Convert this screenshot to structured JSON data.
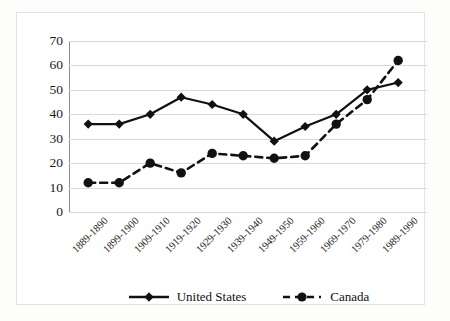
{
  "chart_data": {
    "type": "line",
    "title": "",
    "subtitle": "",
    "xlabel": "",
    "ylabel": "",
    "ylim": [
      0,
      70
    ],
    "ytick_step": 10,
    "yticks": [
      70,
      60,
      50,
      40,
      30,
      20,
      10,
      0
    ],
    "grid": true,
    "legend_position": "bottom",
    "categories": [
      "1889-1890",
      "1899-1900",
      "1909-1910",
      "1919-1920",
      "1929-1930",
      "1939-1940",
      "1949-1950",
      "1959-1960",
      "1969-1970",
      "1979-1980",
      "1989-1990"
    ],
    "series": [
      {
        "name": "United States",
        "values": [
          36,
          36,
          40,
          47,
          44,
          40,
          29,
          35,
          40,
          50,
          53
        ],
        "line_style": "solid",
        "marker": "diamond",
        "color": "#111111"
      },
      {
        "name": "Canada",
        "values": [
          12,
          12,
          20,
          16,
          24,
          23,
          22,
          23,
          36,
          46,
          62
        ],
        "line_style": "dashed",
        "marker": "circle",
        "color": "#111111"
      }
    ]
  },
  "legend": {
    "items": [
      {
        "label": "United States",
        "marker": "diamond-marker-icon",
        "style": "solid"
      },
      {
        "label": "Canada",
        "marker": "circle-marker-icon",
        "style": "dashed"
      }
    ]
  },
  "colors": {
    "series": "#111111",
    "gridline": "#d9d9d9",
    "axis": "#8c8c8c",
    "frame": "#e3e3e3",
    "text": "#1a1a1a",
    "background": "#ffffff"
  }
}
